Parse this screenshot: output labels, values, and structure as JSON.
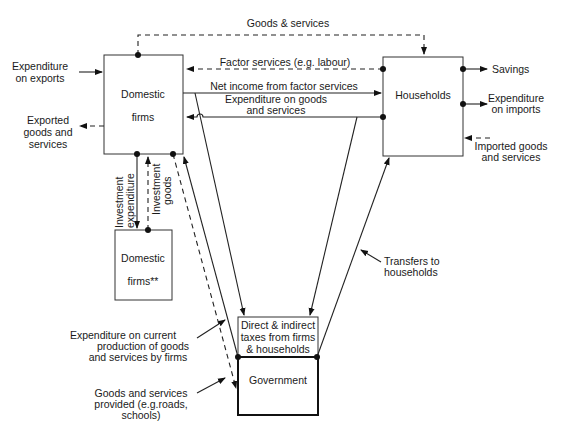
{
  "diagram": {
    "type": "circular-flow",
    "nodes": {
      "domestic_firms": {
        "line1": "Domestic",
        "line2": "firms"
      },
      "households": {
        "label": "Households"
      },
      "domestic_firms_2": {
        "line1": "Domestic",
        "line2": "firms**"
      },
      "taxes": {
        "line1": "Direct & indirect",
        "line2": "taxes from firms",
        "line3": "& households"
      },
      "government": {
        "label": "Government"
      }
    },
    "flows": {
      "goods_services_top": "Goods & services",
      "factor_services": "Factor services (e.g. labour)",
      "net_income": "Net income from factor services",
      "expenditure_goods_l1": "Expenditure on goods",
      "expenditure_goods_l2": "and services",
      "exports_exp_l1": "Expenditure",
      "exports_exp_l2": "on exports",
      "exported_l1": "Exported",
      "exported_l2": "goods and",
      "exported_l3": "services",
      "savings": "Savings",
      "imports_exp_l1": "Expenditure",
      "imports_exp_l2": "on imports",
      "imported_l1": "Imported goods",
      "imported_l2": "and services",
      "invest_exp_l1": "Investment",
      "invest_exp_l2": "expenditure",
      "invest_goods_l1": "Investment",
      "invest_goods_l2": "goods",
      "transfers_l1": "Transfers to",
      "transfers_l2": "households",
      "gov_exp_l1": "Expenditure on current",
      "gov_exp_l2": "production of goods",
      "gov_exp_l3": "and services by firms",
      "gov_goods_l1": "Goods and services",
      "gov_goods_l2": "provided (e.g.roads,",
      "gov_goods_l3": "schools)"
    }
  }
}
